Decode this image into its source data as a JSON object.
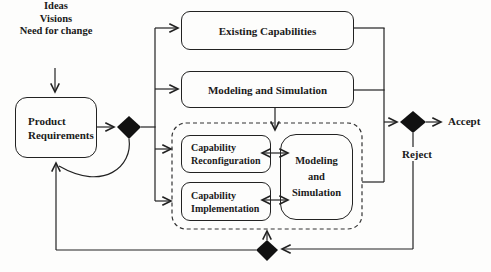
{
  "input_label": [
    "Ideas",
    "Visions",
    "Need for change"
  ],
  "nodes": {
    "product_requirements": [
      "Product",
      "Requirements"
    ],
    "existing_capabilities": "Existing Capabilities",
    "modeling_and_simulation": "Modeling and Simulation",
    "capability_reconfiguration": [
      "Capability",
      "Reconfiguration"
    ],
    "capability_implementation": [
      "Capability",
      "Implementation"
    ],
    "modeling_and_simulation_inner": [
      "Modeling",
      "and",
      "Simulation"
    ]
  },
  "outcome_labels": {
    "accept": "Accept",
    "reject": "Reject"
  },
  "colors": {
    "line": "#222222",
    "text": "#1a1a1a",
    "background": "#fdfdfc",
    "diamond_fill": "#111111"
  }
}
